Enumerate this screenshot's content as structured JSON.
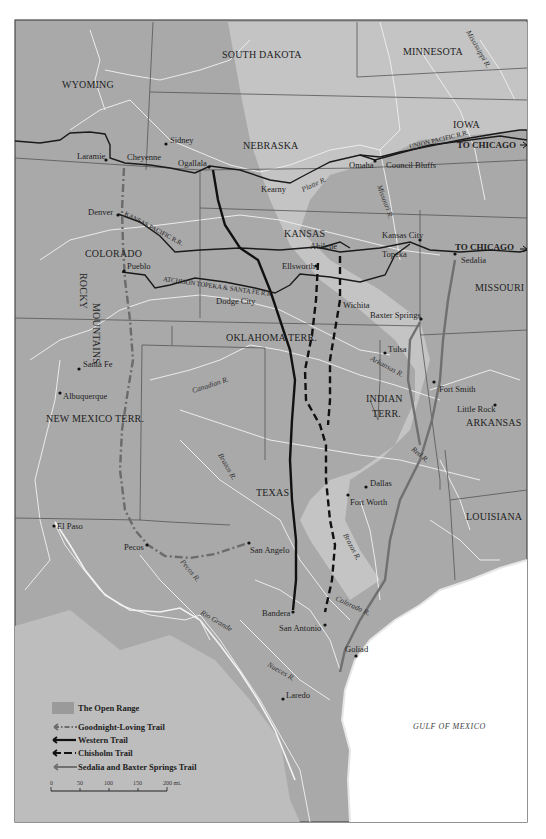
{
  "map": {
    "colors": {
      "land": "#a9a9a9",
      "open_range": "#c8c8c8",
      "light_region": "#bdbdbd",
      "water": "#ffffff",
      "river": "#e8e8e8",
      "border": "#5a5a5a",
      "railroad": "#1a1a1a",
      "goodnight_loving": "#6a6a6a",
      "western": "#111111",
      "chisholm": "#111111",
      "sedalia_baxter": "#707070"
    },
    "states": {
      "wyoming": "WYOMING",
      "south_dakota": "SOUTH DAKOTA",
      "minnesota": "MINNESOTA",
      "iowa": "IOWA",
      "nebraska": "NEBRASKA",
      "colorado": "COLORADO",
      "kansas": "KANSAS",
      "missouri": "MISSOURI",
      "rocky": "ROCKY",
      "mountains": "MOUNTAINS",
      "oklahoma": "OKLAHOMA",
      "terr": "TERR.",
      "new_mexico": "NEW MEXICO  TERR.",
      "indian": "INDIAN",
      "indian_terr": "TERR.",
      "arkansas": "ARKANSAS",
      "texas": "TEXAS",
      "louisiana": "LOUISIANA"
    },
    "cities": {
      "laramie": "Laramie",
      "cheyenne": "Cheyenne",
      "sidney": "Sidney",
      "ogallala": "Ogallala",
      "kearny": "Kearny",
      "omaha": "Omaha",
      "council_bluffs": "Council Bluffs",
      "denver": "Denver",
      "pueblo": "Pueblo",
      "dodge_city": "Dodge City",
      "ellsworth": "Ellsworth",
      "abilene": "Abilene",
      "kansas_city": "Kansas City",
      "topeka": "Topeka",
      "sedalia": "Sedalia",
      "wichita": "Wichita",
      "baxter_springs": "Baxter Springs",
      "tulsa": "Tulsa",
      "santa_fe": "Santa Fe",
      "albuquerque": "Albuquerque",
      "fort_smith": "Fort Smith",
      "little_rock": "Little Rock",
      "dallas": "Dallas",
      "fort_worth": "Fort Worth",
      "el_paso": "El Paso",
      "pecos": "Pecos",
      "san_angelo": "San Angelo",
      "bandera": "Bandera",
      "san_antonio": "San Antonio",
      "goliad": "Goliad",
      "laredo": "Laredo"
    },
    "rivers": {
      "mississippi": "Mississippi R.",
      "platte": "Platte R.",
      "missouri": "Missouri R.",
      "canadian": "Canadian R.",
      "arkansas": "Arkansas R.",
      "brazos_n": "Brazos R.",
      "brazos_s": "Brazos R.",
      "red": "Red R.",
      "pecos": "Pecos R.",
      "colorado": "Colorado R.",
      "rio_grande": "Rio Grande",
      "nueces": "Nueces R."
    },
    "railroads": {
      "union_pacific": "UNION PACIFIC R.R.",
      "kansas_pacific": "KANSAS PACIFIC R.R.",
      "atchison": "ATCHISON TOPEKA & SANTA FE R.R.",
      "to_chicago_1": "TO CHICAGO",
      "to_chicago_2": "TO CHICAGO"
    },
    "water_label": "GULF OF MEXICO"
  },
  "legend": {
    "items": [
      {
        "key": "open_range",
        "label": "The Open Range"
      },
      {
        "key": "goodnight_loving",
        "label": "Goodnight-Loving Trail"
      },
      {
        "key": "western",
        "label": "Western Trail"
      },
      {
        "key": "chisholm",
        "label": "Chisholm Trail"
      },
      {
        "key": "sedalia_baxter",
        "label": "Sedalia and Baxter Springs Trail"
      }
    ],
    "scale": {
      "ticks": [
        "0",
        "50",
        "100",
        "150",
        "200 mi."
      ]
    }
  }
}
